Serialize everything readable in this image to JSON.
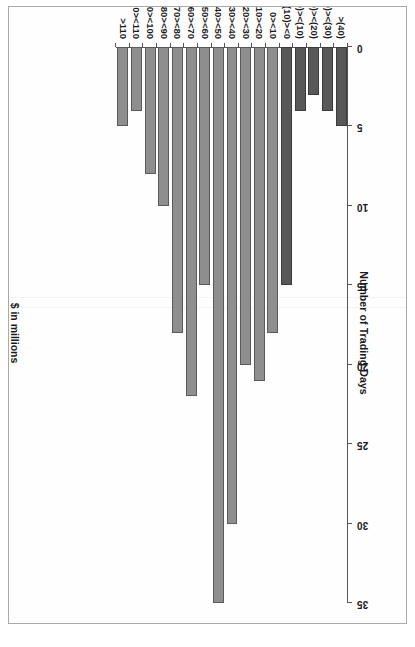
{
  "figure": {
    "caption": ""
  },
  "chart_data": {
    "type": "bar",
    "title": "",
    "xlabel": "$ in millions",
    "ylabel": "Number of Trading Days",
    "orientation": "vertical",
    "grid": false,
    "legend": false,
    "ylim": [
      0,
      35
    ],
    "y_ticks": [
      "0",
      "5",
      "10",
      "15",
      "20",
      "25",
      "30",
      "35"
    ],
    "y_tick_values": [
      0,
      5,
      10,
      15,
      20,
      25,
      30,
      35
    ],
    "categories": [
      ">(40)",
      "(40)><(30)",
      "(30)><(20)",
      "(20)><(10)",
      "(10)><0",
      "0><10",
      "10><20",
      "20><30",
      "30><40",
      "40><50",
      "50><60",
      "60><70",
      "70><80",
      "80><90",
      "90><100",
      "100><110",
      ">110"
    ],
    "values": [
      5,
      4,
      3,
      4,
      15,
      18,
      21,
      20,
      30,
      35,
      15,
      22,
      18,
      10,
      8,
      4,
      5
    ],
    "bar_kinds": [
      "neg",
      "neg",
      "neg",
      "neg",
      "neg",
      "pos",
      "pos",
      "pos",
      "pos",
      "pos",
      "pos",
      "pos",
      "pos",
      "pos",
      "pos",
      "pos",
      "pos"
    ],
    "colors": {
      "positive_bar": "#8e8e8e",
      "negative_bar": "#585858",
      "bar_border": "#4f4f4f",
      "axis": "#555555",
      "text": "#1a1a1a",
      "background": "#ffffff"
    }
  }
}
